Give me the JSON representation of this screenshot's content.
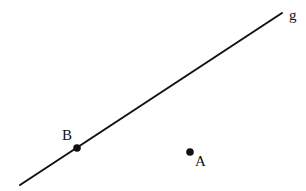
{
  "diagram": {
    "background": "#ffffff",
    "stroke_color": "#111111",
    "line": {
      "name": "g",
      "x1": 20,
      "y1": 185,
      "x2": 282,
      "y2": 13,
      "label": {
        "text": "g",
        "x": 289,
        "y": 20
      }
    },
    "points": [
      {
        "name": "B",
        "cx": 77,
        "cy": 148,
        "r": 3.8,
        "label": {
          "text": "B",
          "x": 62,
          "y": 140
        }
      },
      {
        "name": "A",
        "cx": 190,
        "cy": 152,
        "r": 3.8,
        "label": {
          "text": "A",
          "x": 195,
          "y": 166
        }
      }
    ]
  }
}
